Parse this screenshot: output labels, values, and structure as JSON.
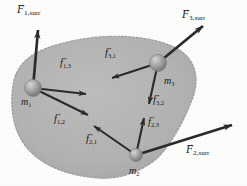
{
  "figure": {
    "type": "physics-free-body-diagram",
    "background_color": "#fdfdfc",
    "blob_fill": "#b3b3b3",
    "blob_edge": "#9a9a9a",
    "vector_color": "#2b2b2b",
    "sphere_color": "#9e9e9e"
  },
  "masses": [
    {
      "id": "m1",
      "base": "m",
      "sub": "1",
      "cx": 33,
      "cy": 88,
      "r": 8.5
    },
    {
      "id": "m2",
      "base": "m",
      "sub": "2",
      "cx": 136,
      "cy": 155,
      "r": 6.5
    },
    {
      "id": "m3",
      "base": "m",
      "sub": "3",
      "cx": 158,
      "cy": 63,
      "r": 8.5
    }
  ],
  "mass_labels": [
    {
      "name": "mass-label-m1",
      "base": "m",
      "sub": "1",
      "x": 21,
      "y": 97
    },
    {
      "name": "mass-label-m2",
      "base": "m",
      "sub": "2",
      "x": 129,
      "y": 166
    },
    {
      "name": "mass-label-m3",
      "base": "m",
      "sub": "3",
      "x": 164,
      "y": 76
    }
  ],
  "external_forces": [
    {
      "name": "force-F1-surr",
      "base": "F",
      "sub": "1,surr",
      "label_x": 17,
      "label_y": 4,
      "from": [
        33,
        88
      ],
      "to": [
        38,
        30
      ]
    },
    {
      "name": "force-F3-surr",
      "base": "F",
      "sub": "3,surr",
      "label_x": 182,
      "label_y": 9,
      "from": [
        158,
        63
      ],
      "to": [
        203,
        26
      ]
    },
    {
      "name": "force-F2-surr",
      "base": "F",
      "sub": "2,surr",
      "label_x": 186,
      "label_y": 144,
      "from": [
        136,
        155
      ],
      "to": [
        232,
        125
      ]
    }
  ],
  "internal_forces": [
    {
      "name": "force-f1-3",
      "base": "f",
      "sub": "1,3",
      "label_x": 60,
      "label_y": 58,
      "from": [
        33,
        88
      ],
      "to": [
        86,
        94
      ]
    },
    {
      "name": "force-f1-2",
      "base": "f",
      "sub": "1,2",
      "label_x": 54,
      "label_y": 114,
      "from": [
        33,
        88
      ],
      "to": [
        88,
        115
      ]
    },
    {
      "name": "force-f3-1",
      "base": "f",
      "sub": "3,1",
      "label_x": 105,
      "label_y": 48,
      "from": [
        158,
        63
      ],
      "to": [
        112,
        78
      ]
    },
    {
      "name": "force-f3-2",
      "base": "f",
      "sub": "3,2",
      "label_x": 153,
      "label_y": 95,
      "from": [
        158,
        63
      ],
      "to": [
        149,
        104
      ]
    },
    {
      "name": "force-f2-1",
      "base": "f",
      "sub": "2,1",
      "label_x": 86,
      "label_y": 134,
      "from": [
        136,
        155
      ],
      "to": [
        94,
        126
      ]
    },
    {
      "name": "force-f2-3",
      "base": "f",
      "sub": "2,3",
      "label_x": 148,
      "label_y": 117,
      "from": [
        136,
        155
      ],
      "to": [
        144,
        118
      ]
    }
  ],
  "vector_arrow_glyph": "→"
}
